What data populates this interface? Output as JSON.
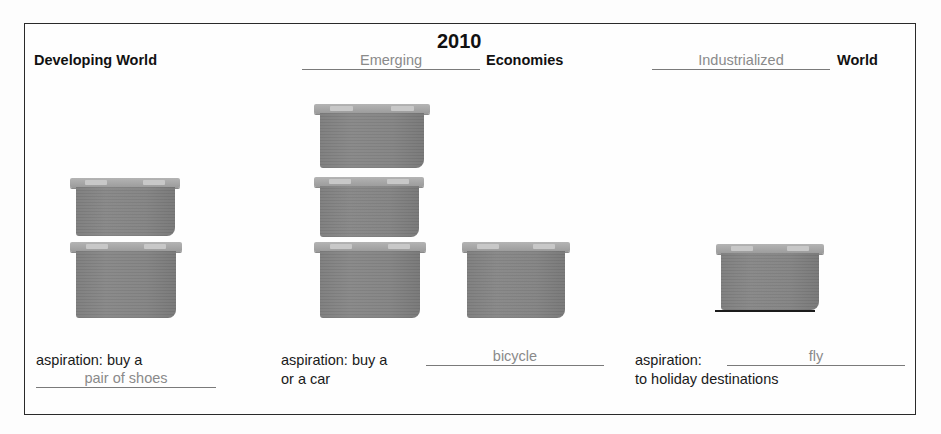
{
  "title": "2010",
  "columns": [
    {
      "title_filled": "",
      "title_static": "Developing World",
      "boxes": 2,
      "aspiration_prefix": "aspiration: buy a",
      "aspiration_fill": "pair of shoes",
      "aspiration_suffix": ""
    },
    {
      "title_filled": "Emerging",
      "title_static": "Economies",
      "boxes": 4,
      "aspiration_prefix": "aspiration: buy a",
      "aspiration_fill": "bicycle",
      "aspiration_suffix": "or a car"
    },
    {
      "title_filled": "Industrialized",
      "title_static": "World",
      "boxes": 1,
      "aspiration_prefix": "aspiration:",
      "aspiration_fill": "fly",
      "aspiration_suffix": "to holiday destinations"
    }
  ],
  "colors": {
    "box_fill": "#838383",
    "box_lid": "#a8a8a8",
    "filled_text": "#8a8a8a",
    "frame": "#2a2a2a"
  }
}
